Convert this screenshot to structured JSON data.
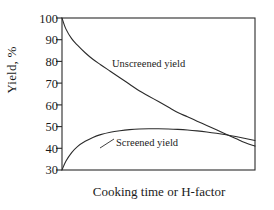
{
  "chart_data": {
    "type": "line",
    "title": "",
    "subtitle": "",
    "xlabel": "Cooking time or H-factor",
    "ylabel": "Yield, %",
    "ylim": [
      30,
      100
    ],
    "yticks": [
      100,
      90,
      80,
      70,
      60,
      50,
      40,
      30
    ],
    "ytick_labels": [
      "100",
      "90",
      "80",
      "70",
      "60",
      "50",
      "40",
      "30"
    ],
    "xlim": [
      0,
      100
    ],
    "xticks": [],
    "xtick_labels": [],
    "grid": false,
    "legend_position": "inline-annotations",
    "box_frame": true,
    "line_color": "#2b2b2b",
    "annotations": [
      {
        "text": "Unscreened yield",
        "series": "unscreened"
      },
      {
        "text": "Screened yield",
        "series": "screened"
      }
    ],
    "series": [
      {
        "name": "Unscreened yield",
        "label": "Unscreened yield",
        "x": [
          0,
          2,
          5,
          8,
          12,
          16,
          20,
          25,
          30,
          35,
          40,
          45,
          50,
          55,
          60,
          65,
          70,
          75,
          80,
          85,
          90,
          95,
          100
        ],
        "values": [
          100,
          95,
          90.5,
          87.5,
          84,
          81,
          78.5,
          75.5,
          72.5,
          69.5,
          66.5,
          64,
          61.5,
          59,
          56.5,
          54.5,
          52.5,
          50.5,
          48.5,
          46.5,
          44.5,
          42.5,
          41
        ]
      },
      {
        "name": "Screened yield",
        "label": "Screened yield",
        "x": [
          0,
          2,
          5,
          8,
          12,
          16,
          20,
          25,
          30,
          35,
          40,
          45,
          50,
          55,
          60,
          65,
          70,
          75,
          80,
          85,
          90,
          95,
          100
        ],
        "values": [
          30,
          34,
          38,
          40.8,
          43.2,
          45,
          46.3,
          47.4,
          48.1,
          48.6,
          48.9,
          49,
          49,
          48.9,
          48.7,
          48.4,
          48,
          47.5,
          46.9,
          46.2,
          45.4,
          44.5,
          43.6
        ]
      }
    ],
    "crossing_note": "Curves intersect near the right side of the plot at about 44% yield"
  },
  "axis": {
    "y_label": "Yield, %",
    "x_label": "Cooking time or H-factor"
  }
}
